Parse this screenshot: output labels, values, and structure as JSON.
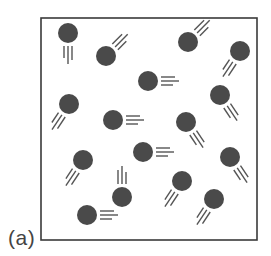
{
  "figure": {
    "label": "(a)",
    "box": {
      "x": 41,
      "y": 18,
      "width": 216,
      "height": 222,
      "stroke": "#3a3a3a"
    },
    "particle_color": "#4a4a4a",
    "trail_color": "#555555",
    "particle_radius": 10,
    "particles": [
      {
        "x": 68,
        "y": 33,
        "trail": "down"
      },
      {
        "x": 106,
        "y": 56,
        "trail": "up-right"
      },
      {
        "x": 188,
        "y": 42,
        "trail": "up-right"
      },
      {
        "x": 240,
        "y": 51,
        "trail": "down-left"
      },
      {
        "x": 148,
        "y": 81,
        "trail": "right"
      },
      {
        "x": 69,
        "y": 104,
        "trail": "down-left"
      },
      {
        "x": 113,
        "y": 120,
        "trail": "right"
      },
      {
        "x": 220,
        "y": 95,
        "trail": "down-right"
      },
      {
        "x": 186,
        "y": 122,
        "trail": "down-right"
      },
      {
        "x": 83,
        "y": 160,
        "trail": "down-left"
      },
      {
        "x": 143,
        "y": 152,
        "trail": "right"
      },
      {
        "x": 230,
        "y": 157,
        "trail": "down-right"
      },
      {
        "x": 122,
        "y": 197,
        "trail": "up"
      },
      {
        "x": 182,
        "y": 181,
        "trail": "down-left"
      },
      {
        "x": 87,
        "y": 215,
        "trail": "right"
      },
      {
        "x": 214,
        "y": 199,
        "trail": "down-left"
      }
    ]
  }
}
